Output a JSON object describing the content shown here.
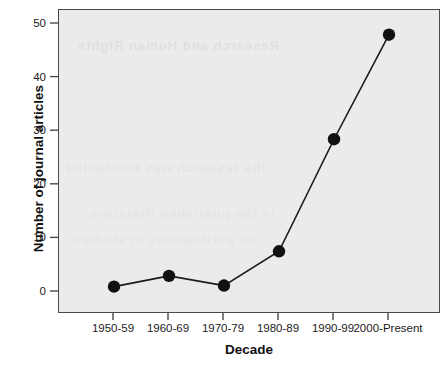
{
  "chart_data": {
    "type": "line",
    "title": "",
    "xlabel": "Decade",
    "ylabel": "Number of journal articles",
    "categories": [
      "1950-59",
      "1960-69",
      "1970-79",
      "1980-89",
      "1990-99",
      "2000-Present"
    ],
    "values": [
      1,
      3,
      1.2,
      7.6,
      28.5,
      48
    ],
    "series": [
      {
        "name": "Number of journal articles",
        "values": [
          1,
          3,
          1.2,
          7.6,
          28.5,
          48
        ]
      }
    ],
    "ylim": [
      -3,
      53
    ],
    "yticks": [
      0,
      10,
      20,
      30,
      40,
      50
    ],
    "ytick_labels": [
      "0",
      "10",
      "20",
      "30",
      "40",
      "50"
    ],
    "xtick_labels": [
      "1950-59",
      "1960-69",
      "1970-79",
      "1980-89",
      "1990-99",
      "2000-Present"
    ],
    "grid": false,
    "legend": "none",
    "marker": "filled-circle",
    "marker_color": "#111111",
    "line_color": "#1a1a1a",
    "panel_background": "#ebebeb",
    "panel_border_color": "#4a4a4a"
  },
  "axes": {
    "y_title": "Number of journal articles",
    "x_title": "Decade"
  },
  "bleed_text": {
    "line1": "Research and Human Rights",
    "line2": "the research was conducted",
    "line3": "in the published literature",
    "line4": "of participants in studies"
  }
}
